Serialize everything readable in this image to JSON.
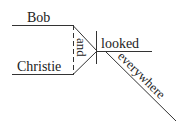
{
  "diagram": {
    "type": "Reed-Kellogg sentence diagram",
    "subjects": [
      "Bob",
      "Christie"
    ],
    "conjunction": "and",
    "verb": "looked",
    "modifier": "everywhere",
    "colors": {
      "line": "#333333",
      "text": "#222222",
      "background": "#ffffff"
    }
  }
}
